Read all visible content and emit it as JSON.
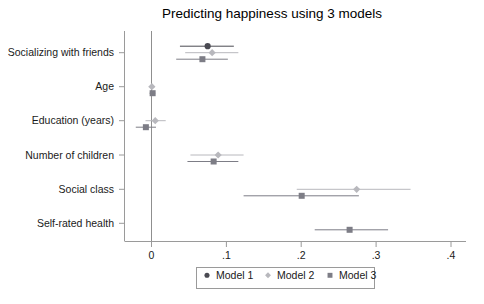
{
  "chart_data": {
    "type": "scatter",
    "subtype": "coefficient-plot",
    "title": "Predicting happiness using 3 models",
    "xlabel": "",
    "ylabel": "",
    "xlim": [
      -0.04,
      0.42
    ],
    "xticks": [
      0,
      0.1,
      0.2,
      0.3,
      0.4
    ],
    "xticklabels": [
      "0",
      ".1",
      ".2",
      ".3",
      ".4"
    ],
    "grid": false,
    "zero_reference_line": 0,
    "legend_position": "bottom-center",
    "categories": [
      "Socializing with friends",
      "Age",
      "Education (years)",
      "Number of children",
      "Social class",
      "Self-rated health"
    ],
    "series": [
      {
        "name": "Model 1",
        "marker": "circle",
        "color": "#4a4a52",
        "points": [
          {
            "category": "Socializing with friends",
            "estimate": 0.075,
            "ci_low": 0.038,
            "ci_high": 0.11
          }
        ]
      },
      {
        "name": "Model 2",
        "marker": "diamond",
        "color": "#b8b8bd",
        "points": [
          {
            "category": "Socializing with friends",
            "estimate": 0.081,
            "ci_low": 0.045,
            "ci_high": 0.116
          },
          {
            "category": "Age",
            "estimate": 0.0005,
            "ci_low": -0.0035,
            "ci_high": 0.004
          },
          {
            "category": "Education (years)",
            "estimate": 0.005,
            "ci_low": -0.008,
            "ci_high": 0.019
          },
          {
            "category": "Number of children",
            "estimate": 0.089,
            "ci_low": 0.052,
            "ci_high": 0.123
          },
          {
            "category": "Social class",
            "estimate": 0.274,
            "ci_low": 0.194,
            "ci_high": 0.346
          }
        ]
      },
      {
        "name": "Model 3",
        "marker": "square",
        "color": "#7d7d86",
        "points": [
          {
            "category": "Socializing with friends",
            "estimate": 0.068,
            "ci_low": 0.033,
            "ci_high": 0.102
          },
          {
            "category": "Age",
            "estimate": 0.0015,
            "ci_low": -0.0025,
            "ci_high": 0.005
          },
          {
            "category": "Education (years)",
            "estimate": -0.0075,
            "ci_low": -0.021,
            "ci_high": 0.006
          },
          {
            "category": "Number of children",
            "estimate": 0.083,
            "ci_low": 0.048,
            "ci_high": 0.116
          },
          {
            "category": "Social class",
            "estimate": 0.2006,
            "ci_low": 0.123,
            "ci_high": 0.277
          },
          {
            "category": "Self-rated health",
            "estimate": 0.2646,
            "ci_low": 0.218,
            "ci_high": 0.316
          }
        ]
      }
    ],
    "legend": [
      {
        "label": "Model 1",
        "marker": "circle",
        "color": "#4a4a52"
      },
      {
        "label": "Model 2",
        "marker": "diamond",
        "color": "#b8b8bd"
      },
      {
        "label": "Model 3",
        "marker": "square",
        "color": "#7d7d86"
      }
    ]
  },
  "axis": {
    "tick_0": "0",
    "tick_1": ".1",
    "tick_2": ".2",
    "tick_3": ".3",
    "tick_4": ".4"
  },
  "categories": {
    "c0": "Socializing with friends",
    "c1": "Age",
    "c2": "Education (years)",
    "c3": "Number of children",
    "c4": "Social class",
    "c5": "Self-rated health"
  },
  "legend": {
    "l0": "Model 1",
    "l1": "Model 2",
    "l2": "Model 3"
  },
  "title": "Predicting happiness using 3 models"
}
